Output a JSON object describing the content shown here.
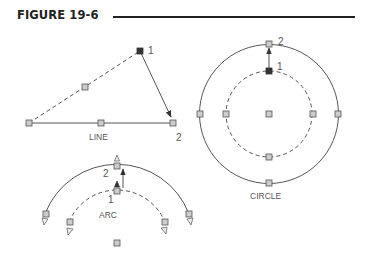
{
  "figure": {
    "title": "FIGURE 19-6"
  },
  "diagrams": {
    "line": {
      "caption": "LINE",
      "point1_label": "1",
      "point2_label": "2"
    },
    "circle": {
      "caption": "CIRCLE",
      "point1_label": "1",
      "point2_label": "2"
    },
    "arc": {
      "caption": "ARC",
      "point1_label": "1",
      "point2_label": "2"
    }
  },
  "colors": {
    "ink": "#444444",
    "grip_fill": "#cccccc",
    "grip_hot": "#333333",
    "title": "#222222"
  }
}
